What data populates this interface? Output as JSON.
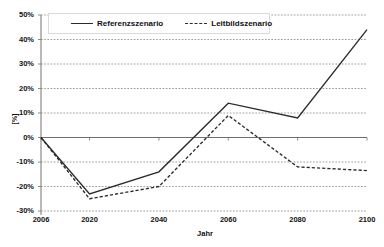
{
  "chart_data": {
    "type": "line",
    "title": "",
    "xlabel": "Jahr",
    "ylabel": "[%]",
    "x": [
      2006,
      2020,
      2040,
      2060,
      2080,
      2100
    ],
    "categories": [
      "2006",
      "2020",
      "2040",
      "2060",
      "2080",
      "2100"
    ],
    "xlim": [
      2006,
      2100
    ],
    "ylim": [
      -30,
      50
    ],
    "ytick_labels": [
      "50%",
      "40%",
      "30%",
      "20%",
      "10%",
      "0%",
      "-10%",
      "-20%",
      "-30%"
    ],
    "ytick_values": [
      50,
      40,
      30,
      20,
      10,
      0,
      -10,
      -20,
      -30
    ],
    "grid": true,
    "grid_style": "dotted-horizontal",
    "legend_position": "top-left-inside",
    "series": [
      {
        "name": "Referenzszenario",
        "style": "solid",
        "color": "#2b2b2b",
        "values": [
          0,
          -23,
          -14,
          14,
          8,
          44
        ]
      },
      {
        "name": "Leitbildszenario",
        "style": "dashed",
        "color": "#2b2b2b",
        "values": [
          0,
          -25,
          -20,
          9,
          -12,
          -13.5
        ]
      }
    ]
  },
  "legend": {
    "items": [
      {
        "label": "Referenzszenario",
        "marker": "solid-line-icon"
      },
      {
        "label": "Leitbildszenario",
        "marker": "dashed-line-icon"
      }
    ]
  },
  "axes": {
    "y_title": "[%]",
    "x_title": "Jahr"
  }
}
